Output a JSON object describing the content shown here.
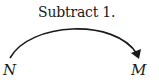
{
  "diagram": {
    "operation_label": "Subtract 1.",
    "source_node": "N",
    "target_node": "M",
    "arrow": {
      "from": "N",
      "to": "M",
      "shape": "arc",
      "color": "#1a1a1a"
    }
  }
}
